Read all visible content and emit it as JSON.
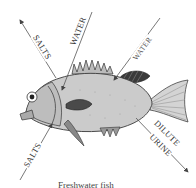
{
  "diagram": {
    "labels": {
      "salts_out": "SALTS",
      "water_in_gills": "WATER",
      "water_in_body": "WATER",
      "salts_in": "SALTS",
      "urine": [
        "DILUTE",
        "URINE"
      ]
    },
    "caption": "Freshwater fish",
    "colors": {
      "fish_body": "#c9c9c9",
      "fish_outline": "#3a3a3a",
      "fin_dark": "#2e2e2e",
      "arrow": "#555555",
      "text": "#333333"
    }
  }
}
